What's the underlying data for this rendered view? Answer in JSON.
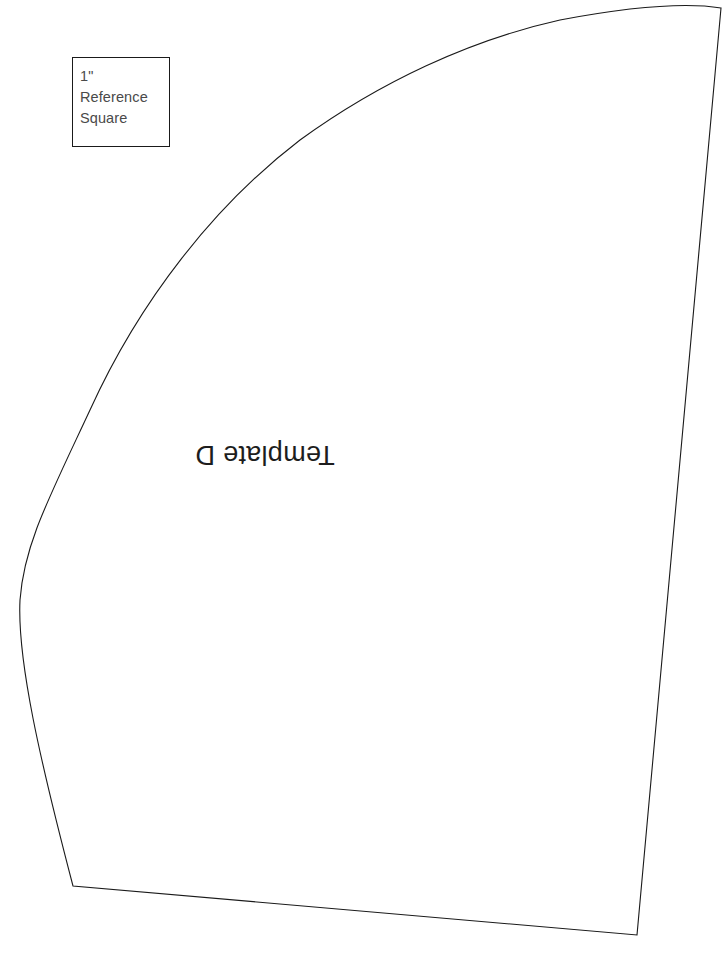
{
  "document": {
    "title": "Template D Cutting Pattern",
    "background_color": "#ffffff",
    "width": 727,
    "height": 966
  },
  "reference_square": {
    "name": "1 inch reference square",
    "line_1": "1\"",
    "line_2": "Reference",
    "line_3": "Square",
    "text_color": "#4a4a4a",
    "border_color": "#1a1a1a",
    "x": 72,
    "y": 57,
    "width": 98,
    "height": 90
  },
  "template": {
    "label": "Template D",
    "label_rotation_degrees": 180,
    "label_color": "#1d1d1d",
    "outline_color": "#1a1a1a",
    "outline_width": 1,
    "fill": "none",
    "shape": "curved wedge / quarter-arc sector",
    "vertices": {
      "top_right": [
        721,
        8
      ],
      "bottom_right": [
        637,
        935
      ],
      "bottom_left": [
        73,
        886
      ],
      "arc_apex": [
        650,
        6
      ],
      "arc_leftmost": [
        20,
        572
      ]
    },
    "path": "M 721 8 C 690 3 640 5 560 20 C 470 40 380 82 300 140 C 215 205 140 300 90 410 C 48 500 24 545 20 600 C 17 660 40 760 73 886 L 637 935 C 660 700 690 350 721 8 Z"
  }
}
